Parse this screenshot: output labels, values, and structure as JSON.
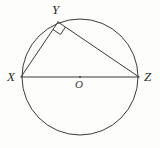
{
  "figure": {
    "kind": "geometry-diagram",
    "background_color": "#fdfdfc",
    "stroke_color": "#3a3a3a",
    "label_color": "#2b2b2b",
    "canvas": {
      "width": 160,
      "height": 148
    }
  },
  "circle": {
    "name": "circumscribed-circle",
    "center_x": 80,
    "center_y": 77,
    "radius": 58,
    "stroke_width": 1
  },
  "center_point": {
    "name": "center-O",
    "x": 80,
    "y": 77,
    "dot_radius": 1
  },
  "points": [
    {
      "id": "X",
      "label": "X",
      "x": 21,
      "y": 77,
      "on_circle": true
    },
    {
      "id": "Y",
      "label": "Y",
      "x": 58,
      "y": 22,
      "on_circle": true
    },
    {
      "id": "Z",
      "label": "Z",
      "x": 139,
      "y": 77,
      "on_circle": true
    },
    {
      "id": "O",
      "label": "O",
      "x": 80,
      "y": 77,
      "on_circle": false
    }
  ],
  "segments": [
    {
      "name": "diameter-XZ",
      "from": "X",
      "to": "Z",
      "x1": 21,
      "y1": 77,
      "x2": 139,
      "y2": 77
    },
    {
      "name": "chord-XY",
      "from": "X",
      "to": "Y",
      "x1": 21,
      "y1": 77,
      "x2": 58,
      "y2": 22
    },
    {
      "name": "chord-YZ",
      "from": "Y",
      "to": "Z",
      "x1": 58,
      "y1": 22,
      "x2": 139,
      "y2": 77
    }
  ],
  "right_angle": {
    "name": "right-angle-mark-at-Y",
    "at_vertex": "Y",
    "size": 9,
    "measure": "90"
  },
  "labels": {
    "x_label": "X",
    "y_label": "Y",
    "z_label": "Z",
    "o_label": "O"
  }
}
